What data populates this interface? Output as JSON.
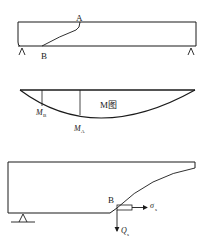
{
  "figure": {
    "top_beam": {
      "label_top": "A",
      "label_bottom": "B"
    },
    "moment_diagram": {
      "title": "M图",
      "label_b": "M",
      "label_b_sub": "B",
      "label_a": "M",
      "label_a_sub": "A"
    },
    "bottom_beam": {
      "label_point": "B",
      "sigma_label": "σ",
      "sigma_sub": "s",
      "shear_label": "Q",
      "shear_sub": "s"
    }
  }
}
